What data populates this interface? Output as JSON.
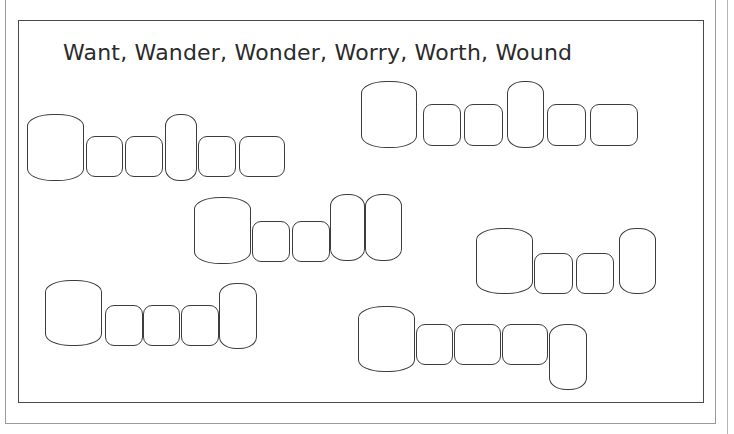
{
  "worksheet": {
    "title": "Want, Wander, Wonder, Worry, Worth, Wound",
    "words": [
      "Want",
      "Wander",
      "Wonder",
      "Worry",
      "Worth",
      "Wound"
    ],
    "shape_boxes": [
      {
        "id": "shape-1",
        "boxes": [
          {
            "type": "tall",
            "x": 27,
            "y": 114,
            "w": 57,
            "h": 67
          },
          {
            "type": "small",
            "x": 86,
            "y": 136,
            "w": 37,
            "h": 41
          },
          {
            "type": "small",
            "x": 125,
            "y": 136,
            "w": 38,
            "h": 41
          },
          {
            "type": "tall",
            "x": 165,
            "y": 114,
            "w": 32,
            "h": 67
          },
          {
            "type": "small",
            "x": 198,
            "y": 136,
            "w": 38,
            "h": 41
          },
          {
            "type": "small",
            "x": 239,
            "y": 136,
            "w": 46,
            "h": 41
          }
        ]
      },
      {
        "id": "shape-2",
        "boxes": [
          {
            "type": "tall",
            "x": 361,
            "y": 81,
            "w": 56,
            "h": 67
          },
          {
            "type": "small",
            "x": 423,
            "y": 104,
            "w": 38,
            "h": 42
          },
          {
            "type": "small",
            "x": 464,
            "y": 104,
            "w": 39,
            "h": 42
          },
          {
            "type": "tall",
            "x": 507,
            "y": 81,
            "w": 37,
            "h": 67
          },
          {
            "type": "small",
            "x": 547,
            "y": 104,
            "w": 39,
            "h": 42
          },
          {
            "type": "small",
            "x": 590,
            "y": 104,
            "w": 48,
            "h": 42
          }
        ]
      },
      {
        "id": "shape-3",
        "boxes": [
          {
            "type": "tall",
            "x": 194,
            "y": 197,
            "w": 57,
            "h": 67
          },
          {
            "type": "small",
            "x": 252,
            "y": 221,
            "w": 38,
            "h": 41
          },
          {
            "type": "small",
            "x": 292,
            "y": 221,
            "w": 38,
            "h": 41
          },
          {
            "type": "tall",
            "x": 330,
            "y": 194,
            "w": 35,
            "h": 67
          },
          {
            "type": "tall",
            "x": 365,
            "y": 194,
            "w": 37,
            "h": 67
          }
        ]
      },
      {
        "id": "shape-4",
        "boxes": [
          {
            "type": "tall",
            "x": 476,
            "y": 228,
            "w": 57,
            "h": 66
          },
          {
            "type": "small",
            "x": 534,
            "y": 253,
            "w": 39,
            "h": 41
          },
          {
            "type": "small",
            "x": 576,
            "y": 253,
            "w": 38,
            "h": 41
          },
          {
            "type": "tall",
            "x": 619,
            "y": 228,
            "w": 37,
            "h": 66
          }
        ]
      },
      {
        "id": "shape-5",
        "boxes": [
          {
            "type": "tall",
            "x": 45,
            "y": 280,
            "w": 57,
            "h": 66
          },
          {
            "type": "small",
            "x": 105,
            "y": 305,
            "w": 38,
            "h": 41
          },
          {
            "type": "small",
            "x": 143,
            "y": 305,
            "w": 37,
            "h": 41
          },
          {
            "type": "small",
            "x": 181,
            "y": 305,
            "w": 38,
            "h": 41
          },
          {
            "type": "tall",
            "x": 219,
            "y": 283,
            "w": 38,
            "h": 66
          }
        ]
      },
      {
        "id": "shape-6",
        "boxes": [
          {
            "type": "tall",
            "x": 358,
            "y": 306,
            "w": 57,
            "h": 66
          },
          {
            "type": "small",
            "x": 416,
            "y": 324,
            "w": 37,
            "h": 41
          },
          {
            "type": "small",
            "x": 454,
            "y": 324,
            "w": 47,
            "h": 41
          },
          {
            "type": "small",
            "x": 502,
            "y": 324,
            "w": 46,
            "h": 41
          },
          {
            "type": "tall",
            "x": 549,
            "y": 324,
            "w": 38,
            "h": 66
          }
        ]
      }
    ]
  }
}
